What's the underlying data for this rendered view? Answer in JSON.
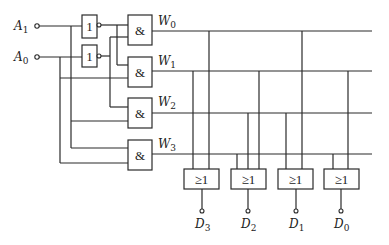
{
  "diagram": {
    "type": "2-to-4 decoder driving OR-gate encoder (ROM structure)",
    "inputs": [
      {
        "name": "A",
        "sub": "1"
      },
      {
        "name": "A",
        "sub": "0"
      }
    ],
    "not_gates": [
      {
        "symbol": "1"
      },
      {
        "symbol": "1"
      }
    ],
    "and_gates": [
      {
        "symbol": "&",
        "output": {
          "name": "W",
          "sub": "0"
        }
      },
      {
        "symbol": "&",
        "output": {
          "name": "W",
          "sub": "1"
        }
      },
      {
        "symbol": "&",
        "output": {
          "name": "W",
          "sub": "2"
        }
      },
      {
        "symbol": "&",
        "output": {
          "name": "W",
          "sub": "3"
        }
      }
    ],
    "or_gates": [
      {
        "symbol": "≥1",
        "output": {
          "name": "D",
          "sub": "3"
        },
        "inputs": [
          "W1",
          "W0"
        ]
      },
      {
        "symbol": "≥1",
        "output": {
          "name": "D",
          "sub": "2"
        },
        "inputs": [
          "W3",
          "W2",
          "W1"
        ]
      },
      {
        "symbol": "≥1",
        "output": {
          "name": "D",
          "sub": "1"
        },
        "inputs": [
          "W2",
          "W0"
        ]
      },
      {
        "symbol": "≥1",
        "output": {
          "name": "D",
          "sub": "0"
        },
        "inputs": [
          "W3",
          "W1"
        ]
      }
    ]
  }
}
